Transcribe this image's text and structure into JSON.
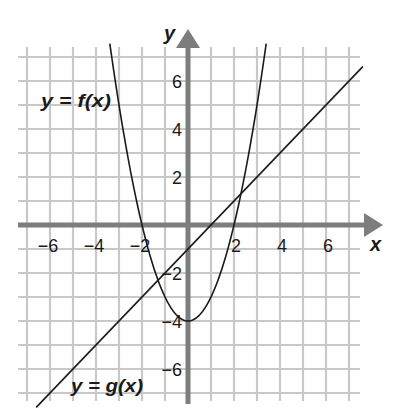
{
  "chart_data": {
    "type": "line",
    "title": "",
    "xlabel": "x",
    "ylabel": "y",
    "xlim": [
      -7,
      7
    ],
    "ylim": [
      -7,
      7
    ],
    "grid": true,
    "x_ticks": [
      -6,
      -4,
      -2,
      2,
      4,
      6
    ],
    "y_ticks": [
      6,
      4,
      2,
      -2,
      -4,
      -6
    ],
    "x_tick_labels": [
      "−6",
      "−4",
      "−2",
      "2",
      "4",
      "6"
    ],
    "y_tick_labels": [
      "6",
      "4",
      "2",
      "−2",
      "−4",
      "−6"
    ],
    "series": [
      {
        "name": "y = f(x)",
        "kind": "parabola",
        "equation": "f(x) = x^2 - 4",
        "vertex": [
          0,
          -4
        ],
        "roots": [
          -2,
          2
        ],
        "x_range": [
          -3.4,
          3.4
        ],
        "points": [
          [
            -3.4,
            7.56
          ],
          [
            -3,
            5
          ],
          [
            -2,
            0
          ],
          [
            -1,
            -3
          ],
          [
            0,
            -4
          ],
          [
            1,
            -3
          ],
          [
            2,
            0
          ],
          [
            3,
            5
          ],
          [
            3.4,
            7.56
          ]
        ]
      },
      {
        "name": "y = g(x)",
        "kind": "line",
        "equation": "g(x) = x - 1",
        "slope": 1,
        "y_intercept": -1,
        "x_intercept": 1,
        "x_range": [
          -6.6,
          7.6
        ],
        "points": [
          [
            -6.6,
            -7.6
          ],
          [
            0,
            -1
          ],
          [
            1,
            0
          ],
          [
            7.6,
            6.6
          ]
        ]
      }
    ],
    "intersections": [
      [
        -1.3,
        -2.3
      ],
      [
        2.3,
        1.3
      ]
    ],
    "annotations": [
      {
        "text": "y = f(x)",
        "near": [
          -4.5,
          4.8
        ]
      },
      {
        "text": "y = g(x)",
        "near": [
          -3.5,
          -6.9
        ]
      }
    ]
  },
  "labels": {
    "x_axis": "x",
    "y_axis": "y",
    "f_label": "y = f(x)",
    "g_label": "y = g(x)"
  },
  "colors": {
    "grid": "#c8c8c8",
    "axis": "#7d7d7d",
    "curve": "#1a1a1a",
    "text": "#1a1a1a"
  }
}
